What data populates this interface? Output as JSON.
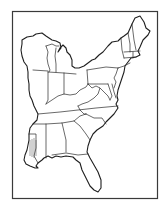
{
  "map": {
    "title": "Eastern United States outline map",
    "style": "black line art on white",
    "colors": {
      "background": "#ffffff",
      "line": "#1e1e1e",
      "frame": "#3a3a3a"
    },
    "labels_visible": false,
    "regions": [
      "Wisconsin",
      "Michigan",
      "Illinois",
      "Indiana",
      "Ohio",
      "Kentucky",
      "Tennessee",
      "Mississippi",
      "Alabama",
      "Georgia",
      "Florida",
      "South Carolina",
      "North Carolina",
      "Virginia",
      "West Virginia",
      "Maryland",
      "Delaware",
      "Pennsylvania",
      "New Jersey",
      "New York",
      "Connecticut",
      "Rhode Island",
      "Massachusetts",
      "Vermont",
      "New Hampshire",
      "Maine",
      "Louisiana (partial)"
    ]
  }
}
